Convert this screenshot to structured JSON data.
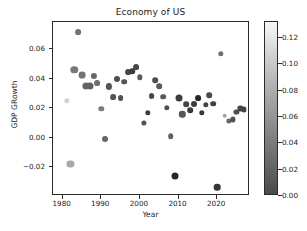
{
  "chart_data": {
    "type": "scatter",
    "title": "Economy of US",
    "xlabel": "Year",
    "ylabel": "GDP GRowth",
    "xlim": [
      1977.5,
      2028.5
    ],
    "ylim": [
      -0.0395,
      0.0785
    ],
    "xticks": [
      1980,
      1990,
      2000,
      2010,
      2020
    ],
    "xticklabels": [
      "1980",
      "1990",
      "2000",
      "2010",
      "2020"
    ],
    "yticks": [
      0.06,
      0.04,
      0.02,
      0.0,
      -0.02
    ],
    "yticklabels": [
      "0.06",
      "0.04",
      "0.02",
      "0.00",
      "−0.02"
    ],
    "grid": false,
    "legend": null,
    "colormap": "gray",
    "colorbar": {
      "label": "",
      "ticks": [
        0.12,
        0.1,
        0.08,
        0.06,
        0.04,
        0.02,
        0.0
      ],
      "ticklabels": [
        "0.12",
        "0.10",
        "0.08",
        "0.06",
        "0.04",
        "0.02",
        "0.00"
      ],
      "vmin": 0.0,
      "vmax": 0.132,
      "orientation": "vertical",
      "low_color": "#4a4a4a",
      "high_color": "#f7f7f7"
    },
    "points": [
      {
        "x": 1981,
        "y": 0.0252,
        "c": 0.108,
        "s": 5.4
      },
      {
        "x": 1982,
        "y": -0.0179,
        "c": 0.082,
        "s": 7.2
      },
      {
        "x": 1983,
        "y": 0.046,
        "c": 0.052,
        "s": 7.4
      },
      {
        "x": 1984,
        "y": 0.0715,
        "c": 0.049,
        "s": 5.8
      },
      {
        "x": 1985,
        "y": 0.0424,
        "c": 0.049,
        "s": 6.8
      },
      {
        "x": 1986,
        "y": 0.0351,
        "c": 0.04,
        "s": 7.2
      },
      {
        "x": 1987,
        "y": 0.0352,
        "c": 0.038,
        "s": 7.0
      },
      {
        "x": 1988,
        "y": 0.042,
        "c": 0.042,
        "s": 6.2
      },
      {
        "x": 1989,
        "y": 0.0368,
        "c": 0.046,
        "s": 5.8
      },
      {
        "x": 1990,
        "y": 0.0195,
        "c": 0.054,
        "s": 5.4
      },
      {
        "x": 1991,
        "y": -0.0009,
        "c": 0.042,
        "s": 6.0
      },
      {
        "x": 1992,
        "y": 0.0348,
        "c": 0.03,
        "s": 6.2
      },
      {
        "x": 1993,
        "y": 0.0275,
        "c": 0.03,
        "s": 5.8
      },
      {
        "x": 1994,
        "y": 0.04,
        "c": 0.026,
        "s": 6.0
      },
      {
        "x": 1995,
        "y": 0.027,
        "c": 0.028,
        "s": 5.8
      },
      {
        "x": 1996,
        "y": 0.038,
        "c": 0.029,
        "s": 5.6
      },
      {
        "x": 1997,
        "y": 0.0446,
        "c": 0.023,
        "s": 5.8
      },
      {
        "x": 1998,
        "y": 0.045,
        "c": 0.016,
        "s": 5.6
      },
      {
        "x": 1999,
        "y": 0.048,
        "c": 0.022,
        "s": 5.8
      },
      {
        "x": 2000,
        "y": 0.041,
        "c": 0.034,
        "s": 5.4
      },
      {
        "x": 2001,
        "y": 0.01,
        "c": 0.028,
        "s": 5.2
      },
      {
        "x": 2002,
        "y": 0.017,
        "c": 0.016,
        "s": 5.4
      },
      {
        "x": 2003,
        "y": 0.028,
        "c": 0.023,
        "s": 5.8
      },
      {
        "x": 2004,
        "y": 0.039,
        "c": 0.027,
        "s": 5.6
      },
      {
        "x": 2005,
        "y": 0.0348,
        "c": 0.034,
        "s": 5.6
      },
      {
        "x": 2006,
        "y": 0.0278,
        "c": 0.032,
        "s": 5.6
      },
      {
        "x": 2007,
        "y": 0.0205,
        "c": 0.029,
        "s": 5.4
      },
      {
        "x": 2008,
        "y": 0.0009,
        "c": 0.038,
        "s": 5.6
      },
      {
        "x": 2009,
        "y": -0.0259,
        "c": 0.003,
        "s": 7.0
      },
      {
        "x": 2010,
        "y": 0.0271,
        "c": 0.016,
        "s": 7.0
      },
      {
        "x": 2011,
        "y": 0.016,
        "c": 0.032,
        "s": 6.4
      },
      {
        "x": 2012,
        "y": 0.0228,
        "c": 0.021,
        "s": 5.6
      },
      {
        "x": 2013,
        "y": 0.0185,
        "c": 0.015,
        "s": 5.6
      },
      {
        "x": 2014,
        "y": 0.0232,
        "c": 0.016,
        "s": 6.0
      },
      {
        "x": 2015,
        "y": 0.027,
        "c": 0.001,
        "s": 5.8
      },
      {
        "x": 2016,
        "y": 0.017,
        "c": 0.013,
        "s": 5.4
      },
      {
        "x": 2017,
        "y": 0.0224,
        "c": 0.021,
        "s": 5.4
      },
      {
        "x": 2018,
        "y": 0.0288,
        "c": 0.024,
        "s": 5.6
      },
      {
        "x": 2019,
        "y": 0.0232,
        "c": 0.018,
        "s": 5.6
      },
      {
        "x": 2020,
        "y": -0.0337,
        "c": 0.012,
        "s": 6.6
      },
      {
        "x": 2021,
        "y": 0.057,
        "c": 0.047,
        "s": 5.4
      },
      {
        "x": 2022,
        "y": 0.015,
        "c": 0.08,
        "s": 4.6
      },
      {
        "x": 2023,
        "y": 0.0116,
        "c": 0.041,
        "s": 5.2
      },
      {
        "x": 2024,
        "y": 0.0125,
        "c": 0.029,
        "s": 5.2
      },
      {
        "x": 2025,
        "y": 0.0178,
        "c": 0.027,
        "s": 5.2
      },
      {
        "x": 2026,
        "y": 0.0199,
        "c": 0.022,
        "s": 5.2
      },
      {
        "x": 2027,
        "y": 0.0192,
        "c": 0.021,
        "s": 5.2
      }
    ]
  }
}
